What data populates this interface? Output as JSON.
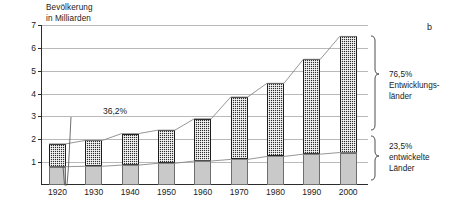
{
  "figure": {
    "letter": "b"
  },
  "chart_data": {
    "type": "bar",
    "title": "",
    "subtitle": "",
    "xlabel": "",
    "ylabel": "Bevölkerung\nin Milliarden",
    "ylim": [
      0,
      7
    ],
    "yticks": [
      1,
      2,
      3,
      4,
      5,
      6,
      7
    ],
    "ytick_labels": [
      "1",
      "2",
      "3",
      "4",
      "5",
      "6",
      "7"
    ],
    "grid": true,
    "grid_axis": "y",
    "stacked": true,
    "legend_position": "right-annotations",
    "categories": [
      "1920",
      "1930",
      "1940",
      "1950",
      "1960",
      "1970",
      "1980",
      "1990",
      "2000"
    ],
    "series": [
      {
        "name": "entwickelte Länder",
        "fill": "light-grey",
        "color": "#c9c9c9",
        "values": [
          0.8,
          0.82,
          0.87,
          0.95,
          1.05,
          1.12,
          1.25,
          1.35,
          1.42
        ]
      },
      {
        "name": "Entwicklungsländer",
        "fill": "dark-checker",
        "color": "#2e2e2e",
        "values": [
          1.0,
          1.13,
          1.38,
          1.45,
          1.85,
          2.73,
          3.2,
          4.15,
          5.08
        ]
      }
    ],
    "totals": [
      1.8,
      1.95,
      2.25,
      2.4,
      2.9,
      3.85,
      4.45,
      5.5,
      6.5
    ],
    "annotations": [
      {
        "name": "share-1920",
        "text": "36,2%",
        "points_to": "1920 entwickelte-Länder-Anteil"
      },
      {
        "name": "share-developing-2000",
        "text": "76,5%",
        "label": "Entwicklungs-\nländer"
      },
      {
        "name": "share-developed-2000",
        "text": "23,5%",
        "label": "entwickelte\nLänder"
      }
    ]
  },
  "side": {
    "developing_pct": "76,5%",
    "developing_label": "Entwicklungs-\nländer",
    "developed_pct": "23,5%",
    "developed_label": "entwickelte\nLänder"
  },
  "callout": {
    "value_1920": "36,2%"
  }
}
